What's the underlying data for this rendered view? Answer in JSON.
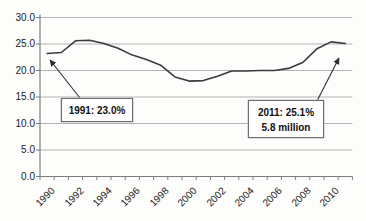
{
  "chart_data": {
    "type": "line",
    "title": "",
    "xlabel": "",
    "ylabel": "",
    "x": [
      1990,
      1991,
      1992,
      1993,
      1994,
      1995,
      1996,
      1997,
      1998,
      1999,
      2000,
      2001,
      2002,
      2003,
      2004,
      2005,
      2006,
      2007,
      2008,
      2009,
      2010,
      2011
    ],
    "series": [
      {
        "name": "percent",
        "values": [
          23.2,
          23.4,
          25.6,
          25.7,
          25.1,
          24.2,
          22.9,
          22.1,
          21.0,
          18.8,
          18.0,
          18.1,
          18.9,
          19.9,
          19.9,
          20.0,
          20.0,
          20.4,
          21.5,
          24.1,
          25.4,
          25.1
        ]
      }
    ],
    "ylim": [
      0,
      30
    ],
    "y_ticks": [
      0,
      5,
      10,
      15,
      20,
      25,
      30
    ],
    "y_tick_labels": [
      "0.0",
      "5.0",
      "10.0",
      "15.0",
      "20.0",
      "25.0",
      "30.0"
    ],
    "x_tick_labels": [
      "1990",
      "1992",
      "1994",
      "1996",
      "1998",
      "2000",
      "2002",
      "2004",
      "2006",
      "2008",
      "2010"
    ],
    "grid": true,
    "legend": "none",
    "annotations": [
      {
        "text": "1991: 23.0%",
        "target_year": 1991
      },
      {
        "text": "2011: 25.1%\n5.8 million",
        "target_year": 2011
      }
    ]
  },
  "colors": {
    "series_line": "#3b3b3b",
    "gridline": "#b3b3b3",
    "axis": "#7d7d7d",
    "arrow": "#2e2e2e",
    "background": "#fdfdfb"
  },
  "callouts": {
    "c1991": {
      "line1": "1991: 23.0%"
    },
    "c2011": {
      "line1": "2011: 25.1%",
      "line2": "5.8 million"
    }
  }
}
